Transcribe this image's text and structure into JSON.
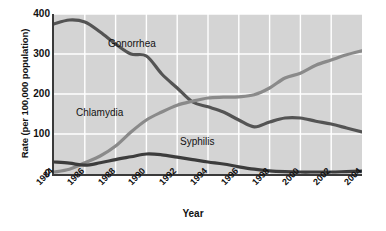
{
  "chart_data": {
    "type": "line",
    "title": "",
    "xlabel": "Year",
    "ylabel": "Rate (per 100,000 population)",
    "xlim": [
      1984,
      2004
    ],
    "ylim": [
      0,
      400
    ],
    "yticks": [
      0,
      100,
      200,
      300,
      400
    ],
    "xticks": [
      1984,
      1986,
      1988,
      1990,
      1992,
      1994,
      1996,
      1998,
      2000,
      2002,
      2004
    ],
    "xtick_labels": [
      "1984",
      "1986",
      "1988",
      "1990",
      "1992",
      "1994",
      "1996",
      "1998",
      "2000",
      "2002",
      "2004"
    ],
    "ytick_labels": [
      "0",
      "100",
      "200",
      "300",
      "400"
    ],
    "grid": true,
    "grid_color": "#ffffff",
    "plot_background": "#d4d4d4",
    "legend_position": "inline-labels",
    "x": [
      1984,
      1985,
      1986,
      1987,
      1988,
      1989,
      1990,
      1991,
      1992,
      1993,
      1994,
      1995,
      1996,
      1997,
      1998,
      1999,
      2000,
      2001,
      2002,
      2003,
      2004
    ],
    "series": [
      {
        "name": "Gonorrhea",
        "color": "#545454",
        "values": [
          375,
          385,
          380,
          355,
          325,
          300,
          295,
          250,
          215,
          180,
          168,
          155,
          135,
          118,
          130,
          140,
          140,
          132,
          125,
          115,
          105
        ]
      },
      {
        "name": "Chlamydia",
        "color": "#8a8a8a",
        "values": [
          5,
          12,
          28,
          45,
          70,
          105,
          135,
          155,
          172,
          182,
          190,
          192,
          193,
          198,
          215,
          240,
          252,
          272,
          285,
          298,
          308
        ]
      },
      {
        "name": "Syphilis",
        "color": "#3c3c3c",
        "values": [
          30,
          27,
          22,
          28,
          36,
          43,
          50,
          48,
          42,
          36,
          30,
          25,
          18,
          12,
          8,
          6,
          5,
          5,
          5,
          6,
          7
        ]
      }
    ]
  },
  "labels": {
    "gonorrhea": "Gonorrhea",
    "chlamydia": "Chlamydia",
    "syphilis": "Syphilis"
  }
}
